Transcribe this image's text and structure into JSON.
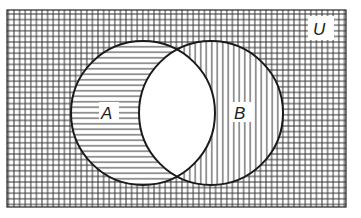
{
  "diagram": {
    "type": "venn",
    "universe_label": "U",
    "sets": [
      {
        "label": "A",
        "shading": "horizontal-lines"
      },
      {
        "label": "B",
        "shading": "vertical-lines"
      }
    ],
    "regions": {
      "outside": "crosshatch",
      "A_only": "horizontal-lines",
      "B_only": "vertical-lines",
      "A_and_B": "unshaded"
    },
    "colors": {
      "ink": "#222222",
      "background": "#ffffff"
    }
  }
}
